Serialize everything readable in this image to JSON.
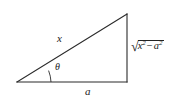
{
  "figure": {
    "background_color": "#ffffff",
    "stroke_color": "#2b2b2b",
    "labels": {
      "hypotenuse": "x",
      "base": "a",
      "angle": "θ",
      "opposite_prefix": "√",
      "opposite_var1": "x",
      "opposite_exp1": "2",
      "opposite_operator": "−",
      "opposite_var2": "a",
      "opposite_exp2": "2",
      "opposite_full": "√(x² − a²)"
    },
    "geometry": {
      "left_vertex": "17,82",
      "right_vertex": "127,82",
      "top_vertex": "127,14",
      "angle_arc_radius": "34"
    }
  }
}
